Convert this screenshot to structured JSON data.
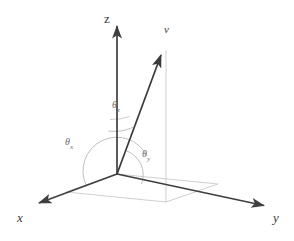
{
  "figure": {
    "background_color": "#ffffff",
    "width": 294,
    "height": 241
  },
  "colors": {
    "axis_stroke": "#3f3f3f",
    "vector_stroke": "#3a3a3a",
    "guide_stroke": "#c8c8c8",
    "arc_stroke": "#b4b4b4",
    "label_dark": "#3a3a3a",
    "label_gray": "#6e6e6e"
  },
  "origin": {
    "x": 117,
    "y": 174
  },
  "axes": [
    {
      "id": "z",
      "label": "z",
      "italic": false,
      "tip": {
        "x": 117,
        "y": 22
      },
      "label_pos": {
        "x": 104,
        "y": 12
      }
    },
    {
      "id": "x",
      "label": "x",
      "italic": true,
      "tip": {
        "x": 35,
        "y": 205
      },
      "label_pos": {
        "x": 17,
        "y": 211
      }
    },
    {
      "id": "y",
      "label": "y",
      "italic": true,
      "tip": {
        "x": 268,
        "y": 207
      },
      "label_pos": {
        "x": 273,
        "y": 211
      }
    }
  ],
  "vector": {
    "id": "v",
    "label": "v",
    "italic": true,
    "tail": {
      "x": 117,
      "y": 174
    },
    "tip": {
      "x": 163,
      "y": 50
    },
    "label_pos": {
      "x": 164,
      "y": 24
    }
  },
  "projection": {
    "vertical_drop": {
      "from": {
        "x": 166,
        "y": 50
      },
      "to": {
        "x": 166,
        "y": 202
      }
    },
    "base_quad": [
      {
        "x": 117,
        "y": 174
      },
      {
        "x": 66,
        "y": 192
      },
      {
        "x": 166,
        "y": 202
      },
      {
        "x": 218,
        "y": 184
      }
    ]
  },
  "angles": [
    {
      "id": "theta-z",
      "symbol": "θ",
      "subscript": "z",
      "label_pos": {
        "x": 112,
        "y": 100
      },
      "description": "angle between v and the positive z-axis"
    },
    {
      "id": "theta-x",
      "symbol": "θ",
      "subscript": "x",
      "label_pos": {
        "x": 65,
        "y": 137
      },
      "description": "angle between v and the positive x-axis"
    },
    {
      "id": "theta-y",
      "symbol": "θ",
      "subscript": "y",
      "label_pos": {
        "x": 142,
        "y": 149
      },
      "description": "angle between v and the positive y-axis"
    }
  ]
}
